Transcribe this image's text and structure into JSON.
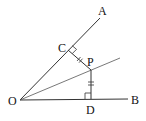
{
  "diagram": {
    "type": "geometry-angle-bisector",
    "points": {
      "O": {
        "label": "O",
        "x": 20,
        "y": 100
      },
      "A": {
        "label": "A",
        "x": 100,
        "y": 18
      },
      "B": {
        "label": "B",
        "x": 128,
        "y": 99
      },
      "C": {
        "label": "C",
        "x": 68,
        "y": 50
      },
      "P": {
        "label": "P",
        "x": 91,
        "y": 70
      },
      "D": {
        "label": "D",
        "x": 91,
        "y": 99
      }
    },
    "labels": {
      "O": "O",
      "A": "A",
      "B": "B",
      "C": "C",
      "P": "P",
      "D": "D"
    },
    "segments": [
      "OA",
      "OB",
      "O-bisector",
      "PC",
      "PD"
    ],
    "marks": [
      "right-angle at C",
      "right-angle at D",
      "PC = PD (double tick)"
    ],
    "line_color": "#333333"
  }
}
